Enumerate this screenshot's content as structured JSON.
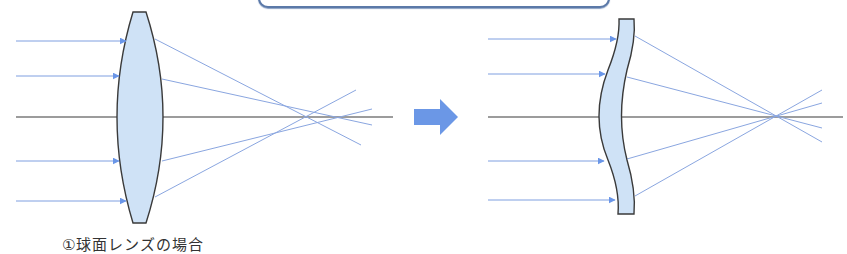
{
  "figure": {
    "left_panel": {
      "lens_type": "biconvex-spherical-lens",
      "caption": "①球面レンズの場合",
      "incoming_ray_y": [
        41,
        76,
        161,
        201
      ],
      "optical_axis_y": 117,
      "focus_behavior": "spherical-aberration (rays cross axis at different points)"
    },
    "transition_arrow": {
      "icon": "right-arrow-icon",
      "color": "#6b97e6"
    },
    "right_panel": {
      "lens_type": "meniscus-aspheric-lens",
      "incoming_ray_y": [
        39,
        74,
        161,
        200
      ],
      "optical_axis_y": 117,
      "focus_behavior": "rays converge to single focal point"
    },
    "colors": {
      "ray": "#6b8fd9",
      "ray_arrowhead": "#6a96e8",
      "lens_fill": "#cfe2f6",
      "lens_stroke": "#3a3a3a",
      "axis": "#3a3a3a",
      "banner_border": "#5b79a8"
    }
  }
}
